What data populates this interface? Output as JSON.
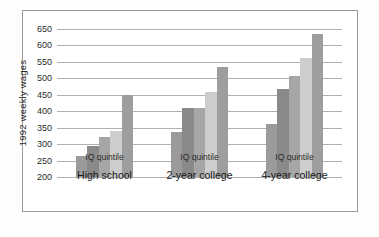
{
  "figure": {
    "background_color": "#fdfdfc",
    "plate_background": "#ffffff",
    "plate_border_color": "#9a9a9a"
  },
  "axis": {
    "y_title": "1992 weekly wages",
    "y_ticks": [
      "650",
      "600",
      "550",
      "500",
      "450",
      "400",
      "350",
      "300",
      "250",
      "200"
    ],
    "gridline_color": "#b0b0b0"
  },
  "groups": [
    {
      "quintile_label": "IQ quintile",
      "label": "High school"
    },
    {
      "quintile_label": "IQ quintile",
      "label": "2-year college"
    },
    {
      "quintile_label": "IQ quintile",
      "label": "4-year college"
    }
  ],
  "chart_data": {
    "type": "bar",
    "title": "",
    "xlabel": "IQ quintile",
    "ylabel": "1992 weekly wages",
    "ylim": [
      200,
      650
    ],
    "ytick_step": 50,
    "grid": "horizontal",
    "legend": "none",
    "categories": [
      "High school",
      "2-year college",
      "4-year college"
    ],
    "group_sublabel": "IQ quintile",
    "series": [
      {
        "name": "Quintile 1",
        "color": "#9b9b9b",
        "values": [
          265,
          337,
          360
        ]
      },
      {
        "name": "Quintile 2",
        "color": "#8a8a8a",
        "values": [
          295,
          410,
          467
        ]
      },
      {
        "name": "Quintile 3",
        "color": "#a6a6a6",
        "values": [
          322,
          410,
          507
        ]
      },
      {
        "name": "Quintile 4",
        "color": "#cdcdcd",
        "values": [
          340,
          460,
          563
        ]
      },
      {
        "name": "Quintile 5",
        "color": "#9e9e9e",
        "values": [
          450,
          535,
          635
        ]
      }
    ]
  }
}
